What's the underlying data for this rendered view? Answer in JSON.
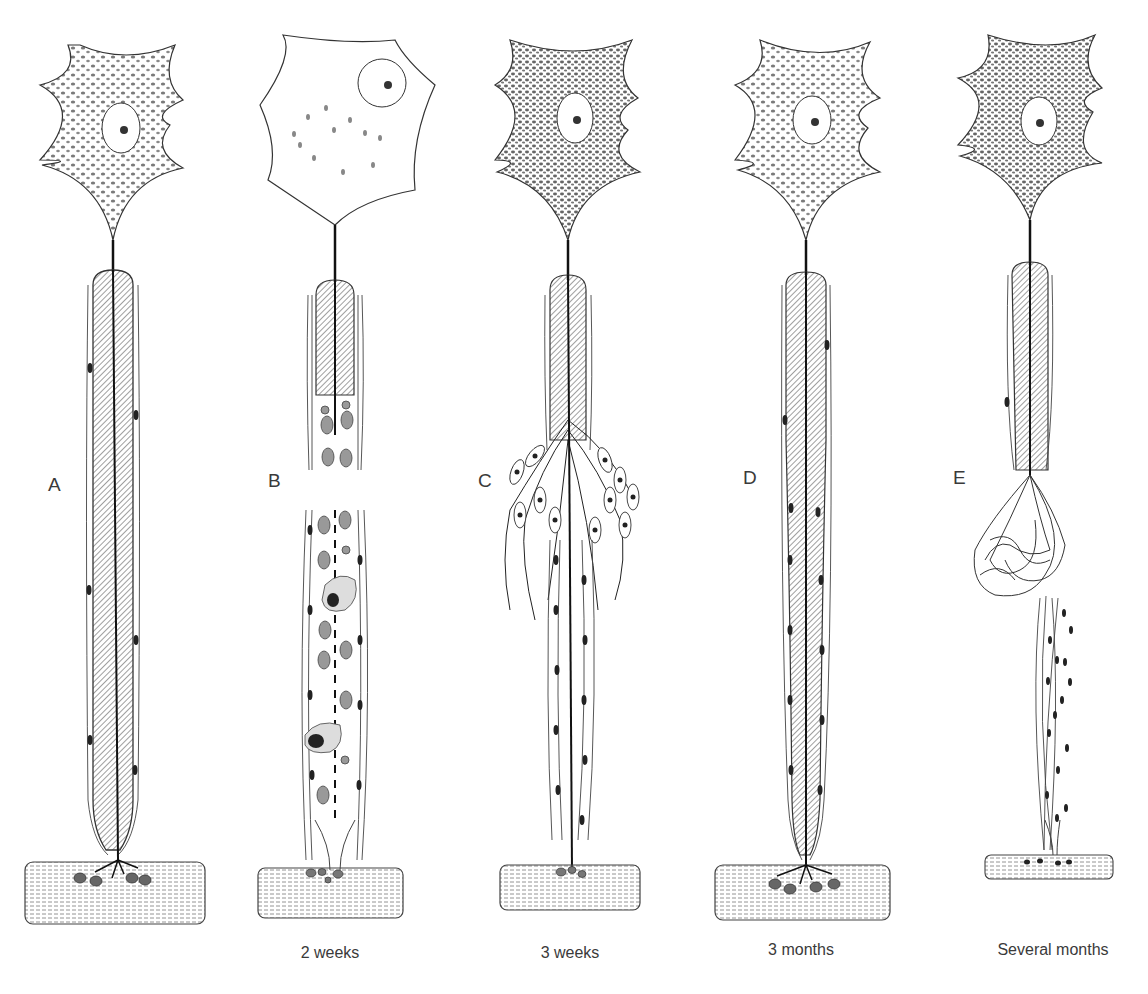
{
  "figure": {
    "colors": {
      "ink": "#222222",
      "hatch": "#6a6a6a",
      "nucleus": "#2a2a2a",
      "background": "#ffffff"
    },
    "panels": [
      {
        "letter": "A",
        "caption": "",
        "stage": "normal neuron"
      },
      {
        "letter": "B",
        "caption": "2 weeks",
        "stage": "degeneration"
      },
      {
        "letter": "C",
        "caption": "3 weeks",
        "stage": "regeneration sprouting"
      },
      {
        "letter": "D",
        "caption": "3 months",
        "stage": "regenerated"
      },
      {
        "letter": "E",
        "caption": "Several months",
        "stage": "neuroma / failed regeneration"
      }
    ]
  }
}
